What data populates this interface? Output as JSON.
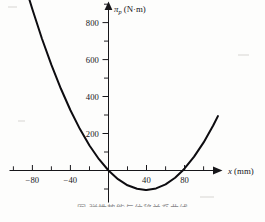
{
  "figure": {
    "background_color": "#fdfdfc",
    "ink_color": "#0d0c10",
    "caption": "图  弹性势能与位移关系曲线"
  },
  "axes": {
    "y_axis": {
      "symbol": "π",
      "subscript": "p",
      "units": "(N·m)",
      "label_full": "πp (N·m)",
      "tick_labels": [
        "200",
        "400",
        "600",
        "800"
      ],
      "tick_values": [
        200,
        400,
        600,
        800
      ],
      "minor_tick_values": [
        -200,
        -100,
        100,
        300,
        500,
        700,
        900
      ],
      "range": [
        -260,
        960
      ]
    },
    "x_axis": {
      "symbol": "x",
      "units": "(mm)",
      "label_full": "x (mm)",
      "tick_labels": [
        "-80",
        "-40",
        "40",
        "80"
      ],
      "tick_values": [
        -80,
        -40,
        40,
        80
      ],
      "minor_tick_values": [
        -100,
        -60,
        -20,
        20,
        60,
        100,
        120
      ],
      "range": [
        -105,
        140
      ]
    }
  },
  "chart_data": {
    "type": "line",
    "title": "",
    "xlabel": "x (mm)",
    "ylabel": "πp (N·m)",
    "xlim": [
      -105,
      140
    ],
    "ylim": [
      -260,
      960
    ],
    "grid": false,
    "legend": null,
    "curve_description": "upward-opening parabola, minimum below the x-axis near x = 40 mm, crossing zero near x = 0 and x = 78 mm",
    "equation": "πp = 0.069 x (x - 78)",
    "vertex": {
      "x": 39,
      "y": -105
    },
    "roots": [
      0,
      78
    ],
    "series": [
      {
        "name": "πp(x)",
        "x": [
          -85,
          -80,
          -70,
          -60,
          -50,
          -40,
          -30,
          -20,
          -10,
          0,
          10,
          20,
          30,
          39,
          40,
          50,
          60,
          70,
          78,
          80,
          90,
          100,
          110,
          115
        ],
        "values": [
          955,
          872,
          714,
          571,
          442,
          326,
          224,
          135,
          61,
          0,
          -47,
          -80,
          -99,
          -105,
          -105,
          -97,
          -75,
          -39,
          0,
          11,
          75,
          152,
          243,
          294
        ]
      }
    ]
  }
}
